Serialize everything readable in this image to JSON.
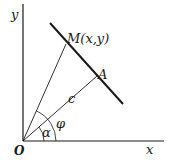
{
  "diagram": {
    "type": "geometry",
    "axes": {
      "x_label": "x",
      "y_label": "y",
      "origin_label": "O"
    },
    "points": {
      "origin": "O",
      "point_m": "M(x,y)",
      "point_a": "A"
    },
    "segment_labels": {
      "oa": "c"
    },
    "angle_labels": {
      "alpha": "α",
      "phi": "φ"
    },
    "colors": {
      "ink": "#1a1a1a",
      "background": "#ffffff"
    }
  }
}
